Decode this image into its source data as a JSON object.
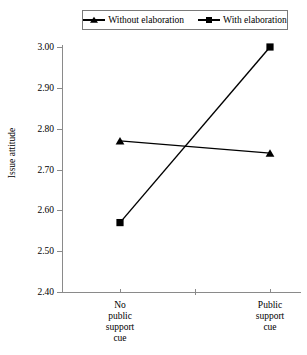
{
  "chart_data": {
    "type": "line",
    "title": "",
    "xlabel": "",
    "ylabel": "Issue attitude",
    "categories": [
      "No public support cue",
      "Public support cue"
    ],
    "category_lines": [
      [
        "No",
        "public",
        "support",
        "cue"
      ],
      [
        "Public",
        "support",
        "cue"
      ]
    ],
    "ylim": [
      2.4,
      3.0
    ],
    "ytick_labels": [
      "3.00",
      "2.90",
      "2.80",
      "2.70",
      "2.60",
      "2.50",
      "2.40"
    ],
    "ytick_values": [
      3.0,
      2.9,
      2.8,
      2.7,
      2.6,
      2.5,
      2.4
    ],
    "grid": false,
    "legend_position": "top",
    "series": [
      {
        "name": "Without elaboration",
        "marker": "triangle",
        "color": "#000000",
        "values": [
          2.77,
          2.74
        ]
      },
      {
        "name": "With elaboration",
        "marker": "square",
        "color": "#000000",
        "values": [
          2.57,
          3.0
        ]
      }
    ]
  },
  "legend": {
    "entries": [
      {
        "label": "Without elaboration",
        "marker": "triangle-marker"
      },
      {
        "label": "With elaboration",
        "marker": "square-marker"
      }
    ]
  },
  "axes": {
    "y_title": "Issue attitude"
  }
}
